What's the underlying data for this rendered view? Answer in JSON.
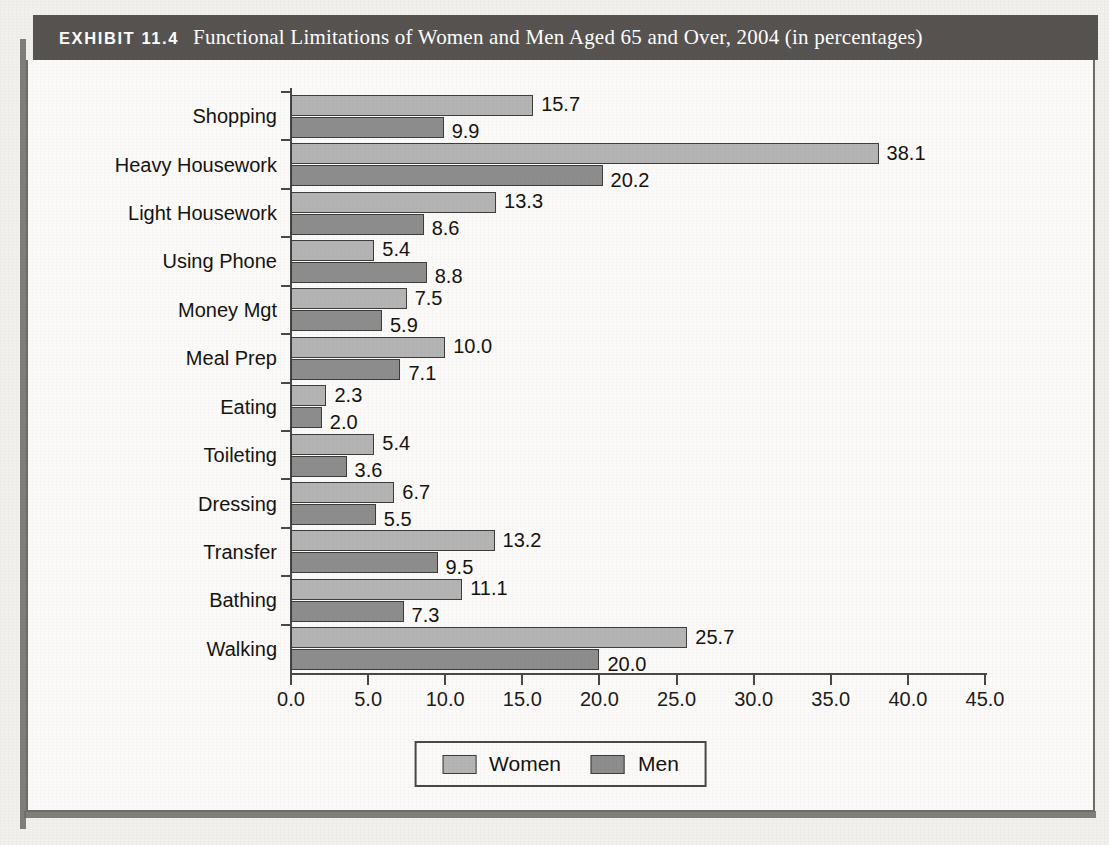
{
  "exhibit": {
    "label": "EXHIBIT 11.4",
    "title": "Functional Limitations of Women and Men Aged 65 and Over, 2004 (in percentages)"
  },
  "legend": {
    "position": "bottom-center",
    "items": [
      {
        "name": "Women",
        "color": "#b4b4b4"
      },
      {
        "name": "Men",
        "color": "#8d8d8d"
      }
    ]
  },
  "chart_data": {
    "type": "bar",
    "orientation": "horizontal",
    "title": "Functional Limitations of Women and Men Aged 65 and Over, 2004 (in percentages)",
    "xlabel": "",
    "ylabel": "",
    "xlim": [
      0.0,
      45.0
    ],
    "xticks": [
      "0.0",
      "5.0",
      "10.0",
      "15.0",
      "20.0",
      "25.0",
      "30.0",
      "35.0",
      "40.0",
      "45.0"
    ],
    "grid": false,
    "legend_position": "bottom-center",
    "categories": [
      "Shopping",
      "Heavy Housework",
      "Light Housework",
      "Using Phone",
      "Money Mgt",
      "Meal Prep",
      "Eating",
      "Toileting",
      "Dressing",
      "Transfer",
      "Bathing",
      "Walking"
    ],
    "series": [
      {
        "name": "Women",
        "color": "#b4b4b4",
        "values": [
          15.7,
          38.1,
          13.3,
          5.4,
          7.5,
          10.0,
          2.3,
          5.4,
          6.7,
          13.2,
          11.1,
          25.7
        ],
        "labels": [
          "15.7",
          "38.1",
          "13.3",
          "5.4",
          "7.5",
          "10.0",
          "2.3",
          "5.4",
          "6.7",
          "13.2",
          "11.1",
          "25.7"
        ]
      },
      {
        "name": "Men",
        "color": "#8d8d8d",
        "values": [
          9.9,
          20.2,
          8.6,
          8.8,
          5.9,
          7.1,
          2.0,
          3.6,
          5.5,
          9.5,
          7.3,
          20.0
        ],
        "labels": [
          "9.9",
          "20.2",
          "8.6",
          "8.8",
          "5.9",
          "7.1",
          "2.0",
          "3.6",
          "5.5",
          "9.5",
          "7.3",
          "20.0"
        ]
      }
    ]
  }
}
